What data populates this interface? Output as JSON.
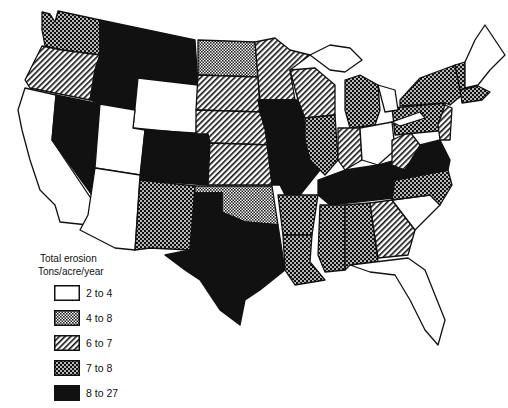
{
  "legend": {
    "title_line1": "Total erosion",
    "title_line2": "Tons/acre/year",
    "items": [
      {
        "label": "2 to 4",
        "pattern": "white"
      },
      {
        "label": "4 to 8",
        "pattern": "fine-dots"
      },
      {
        "label": "6 to 7",
        "pattern": "diagonal"
      },
      {
        "label": "7 to 8",
        "pattern": "checker"
      },
      {
        "label": "8 to 27",
        "pattern": "black"
      }
    ]
  },
  "states": {
    "WA": "7 to 8",
    "OR": "6 to 7",
    "CA": "2 to 4",
    "NV": "8 to 27",
    "ID": "8 to 27",
    "MT": "8 to 27",
    "WY": "2 to 4",
    "UT": "2 to 4",
    "AZ": "2 to 4",
    "CO": "8 to 27",
    "NM": "7 to 8",
    "ND": "4 to 8",
    "SD": "6 to 7",
    "NE": "6 to 7",
    "KS": "6 to 7",
    "OK": "4 to 8",
    "TX": "8 to 27",
    "MN": "6 to 7",
    "IA": "8 to 27",
    "MO": "8 to 27",
    "AR": "7 to 8",
    "LA": "7 to 8",
    "WI": "6 to 7",
    "IL": "7 to 8",
    "MI": "4 to 8",
    "IN": "6 to 7",
    "OH": "2 to 4",
    "KY": "8 to 27",
    "TN": "8 to 27",
    "MS": "7 to 8",
    "AL": "7 to 8",
    "GA": "6 to 7",
    "FL": "2 to 4",
    "SC": "2 to 4",
    "NC": "7 to 8",
    "VA": "8 to 27",
    "WV": "6 to 7",
    "PA": "7 to 8",
    "NY": "7 to 8",
    "VT": "7 to 8",
    "NH": "2 to 4",
    "ME": "2 to 4",
    "MA": "7 to 8",
    "CT": "7 to 8",
    "NJ": "6 to 7",
    "MD": "6 to 7",
    "DE": "6 to 7"
  }
}
